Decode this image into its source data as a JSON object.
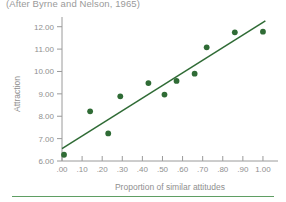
{
  "source_note": "(After Byrne and Nelson, 1965)",
  "chart_data": {
    "type": "scatter",
    "title": "",
    "subtitle": "(After Byrne and Nelson, 1965)",
    "xlabel": "Proportion of similar attitudes",
    "ylabel": "Attraction",
    "xlim": [
      0.0,
      1.05
    ],
    "ylim": [
      6.0,
      12.3
    ],
    "grid": false,
    "legend": null,
    "xticks": [
      0.0,
      0.1,
      0.2,
      0.3,
      0.4,
      0.5,
      0.6,
      0.7,
      0.8,
      0.9,
      1.0
    ],
    "xticklabels": [
      ".00",
      ".10",
      ".20",
      ".30",
      ".40",
      ".50",
      ".60",
      ".70",
      ".80",
      ".90",
      "1.00"
    ],
    "yticks": [
      6.0,
      7.0,
      8.0,
      9.0,
      10.0,
      11.0,
      12.0
    ],
    "yticklabels": [
      "6.00",
      "7.00",
      "8.00",
      "9.00",
      "10.00",
      "11.00",
      "12.00"
    ],
    "points": [
      {
        "x": 0.01,
        "y": 6.28
      },
      {
        "x": 0.14,
        "y": 8.22
      },
      {
        "x": 0.23,
        "y": 7.23
      },
      {
        "x": 0.29,
        "y": 8.89
      },
      {
        "x": 0.43,
        "y": 9.48
      },
      {
        "x": 0.51,
        "y": 8.97
      },
      {
        "x": 0.57,
        "y": 9.58
      },
      {
        "x": 0.66,
        "y": 9.9
      },
      {
        "x": 0.72,
        "y": 11.08
      },
      {
        "x": 0.86,
        "y": 11.75
      },
      {
        "x": 1.0,
        "y": 11.78
      }
    ],
    "fit_line": {
      "x0": 0.0,
      "y0": 6.55,
      "x1": 1.012,
      "y1": 12.26
    },
    "marker_color": "#2f6b35",
    "line_color": "#2f6b35",
    "axis_color": "#9a9a9a",
    "text_color": "#8f8f8f",
    "footer_rule_color": "#5f9e63",
    "background": "#ffffff"
  }
}
